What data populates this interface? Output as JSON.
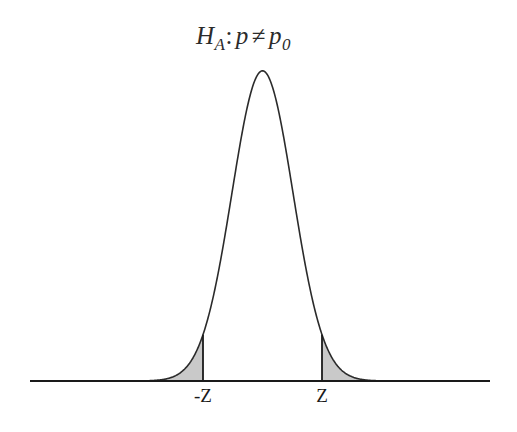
{
  "figure": {
    "title": {
      "full_text": "HA: p ≠ p0",
      "symbol": "H",
      "symbol_subscript": "A",
      "colon": ":",
      "parameter": "p",
      "operator": "≠",
      "null_value": "p",
      "null_value_subscript": "0"
    },
    "background_color": "#ffffff",
    "curve_color": "#2b2b2b",
    "shade_color": "#c9c9c9",
    "axis_color": "#1a1a1a"
  },
  "axis": {
    "labels": [
      {
        "text": "-Z",
        "x_px": 203
      },
      {
        "text": "Z",
        "x_px": 322
      }
    ],
    "baseline_y_px": 381,
    "x_start_px": 30,
    "x_end_px": 490
  },
  "cutoffs": {
    "left_label": "-Z",
    "right_label": "Z",
    "left_x_px": 203,
    "right_x_px": 322
  },
  "chart_data": {
    "type": "area",
    "xlabel": "",
    "ylabel": "",
    "distribution": "standard normal",
    "mean": 0,
    "sd": 1,
    "xlim": [
      -4.3,
      3.72
    ],
    "ylim": [
      0,
      0.4
    ],
    "grid": false,
    "legend": null,
    "test_type": "two-tailed",
    "critical_values": [
      -1.95,
      1.95
    ],
    "critical_labels": [
      "-Z",
      "Z"
    ],
    "shaded_regions": [
      {
        "name": "left-tail",
        "from": -4.3,
        "to": -1.95,
        "color": "#c9c9c9"
      },
      {
        "name": "right-tail",
        "from": 1.95,
        "to": 3.72,
        "color": "#c9c9c9"
      }
    ],
    "x": [
      -4.3,
      -4.0,
      -3.7,
      -3.4,
      -3.1,
      -2.8,
      -2.5,
      -2.2,
      -1.95,
      -1.7,
      -1.4,
      -1.1,
      -0.8,
      -0.5,
      -0.2,
      0,
      0.2,
      0.5,
      0.8,
      1.1,
      1.4,
      1.7,
      1.95,
      2.2,
      2.5,
      2.8,
      3.1,
      3.4,
      3.72
    ],
    "y": [
      0.0,
      0.0001,
      0.0004,
      0.0012,
      0.0033,
      0.0079,
      0.0175,
      0.0355,
      0.0596,
      0.094,
      0.1497,
      0.2179,
      0.2897,
      0.3521,
      0.391,
      0.3989,
      0.391,
      0.3521,
      0.2897,
      0.2179,
      0.1497,
      0.094,
      0.0596,
      0.0355,
      0.0175,
      0.0079,
      0.0033,
      0.0012,
      0.0003
    ]
  }
}
